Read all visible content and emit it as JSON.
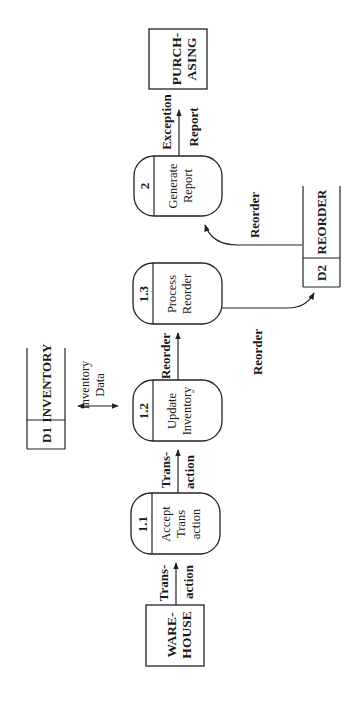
{
  "diagram": {
    "type": "data-flow-diagram",
    "orientation": "rotated-90-ccw",
    "colors": {
      "stroke": "#222222",
      "text": "#1a1a1a",
      "background": "#ffffff"
    },
    "external_entities": [
      {
        "id": "warehouse",
        "lines": [
          "WARE-",
          "HOUSE"
        ]
      },
      {
        "id": "purchasing",
        "lines": [
          "PURCH-",
          "ASING"
        ]
      }
    ],
    "processes": [
      {
        "id": "p1_1",
        "number": "1.1",
        "lines": [
          "Accept",
          "Trans",
          "action"
        ]
      },
      {
        "id": "p1_2",
        "number": "1.2",
        "lines": [
          "Update",
          "Inventory"
        ]
      },
      {
        "id": "p1_3",
        "number": "1.3",
        "lines": [
          "Process",
          "Reorder"
        ]
      },
      {
        "id": "p2",
        "number": "2",
        "lines": [
          "Generate",
          "Report"
        ]
      }
    ],
    "data_stores": [
      {
        "id": "d1",
        "code": "D1",
        "name": "INVENTORY"
      },
      {
        "id": "d2",
        "code": "D2",
        "name": "REORDER"
      }
    ],
    "flows": [
      {
        "from": "warehouse",
        "to": "p1_1",
        "lines": [
          "Trans-",
          "action"
        ]
      },
      {
        "from": "p1_1",
        "to": "p1_2",
        "lines": [
          "Trans-",
          "action"
        ]
      },
      {
        "from": "d1",
        "to": "p1_2",
        "bidirectional": true,
        "lines": [
          "Inventory",
          "Data"
        ]
      },
      {
        "from": "p1_2",
        "to": "p1_3",
        "lines": [
          "Reorder"
        ]
      },
      {
        "from": "p1_3",
        "to": "d2",
        "lines": [
          "Reorder"
        ]
      },
      {
        "from": "d2",
        "to": "p2",
        "lines": [
          "Reorder"
        ]
      },
      {
        "from": "p2",
        "to": "purchasing",
        "lines": [
          "Exception",
          "Report"
        ]
      }
    ]
  }
}
